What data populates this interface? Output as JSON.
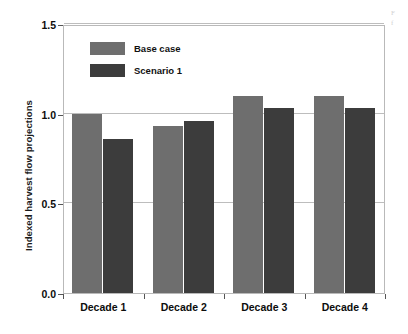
{
  "chart_data": {
    "type": "bar",
    "title": "",
    "xlabel": "",
    "ylabel": "Indexed harvest flow projections",
    "categories": [
      "Decade 1",
      "Decade 2",
      "Decade 3",
      "Decade 4"
    ],
    "series": [
      {
        "name": "Base case",
        "color": "#6e6e6e",
        "values": [
          1.0,
          0.93,
          1.1,
          1.1
        ]
      },
      {
        "name": "Scenario 1",
        "color": "#3c3c3c",
        "values": [
          0.86,
          0.96,
          1.03,
          1.03
        ]
      }
    ],
    "ylim": [
      0.0,
      1.5
    ],
    "yticks": [
      0.0,
      0.5,
      1.0,
      1.5
    ],
    "ytick_labels": [
      "0.0",
      "0.5",
      "1.0",
      "1.5"
    ],
    "grid": true,
    "gridlines_at": [
      0.5,
      1.0,
      1.5
    ],
    "legend_position": "upper left inside"
  },
  "margin_note": {
    "line1": "F",
    "line2": "f"
  }
}
